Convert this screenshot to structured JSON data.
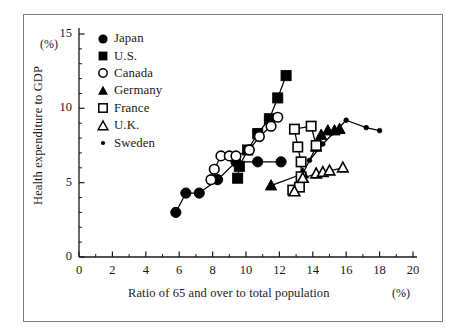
{
  "figure": {
    "frame": {
      "border_color": "#7d7d7d"
    }
  },
  "chart_data": {
    "type": "scatter",
    "title": "",
    "xlabel": "Ratio of 65 and over to total population",
    "ylabel": "Health expenditure to GDP",
    "x_unit": "(%)",
    "y_unit": "(%)",
    "xlim": [
      0,
      20
    ],
    "ylim": [
      0,
      15
    ],
    "xticks": [
      0,
      2,
      4,
      6,
      8,
      10,
      12,
      14,
      16,
      18,
      20
    ],
    "yticks": [
      0,
      5,
      10,
      15
    ],
    "xtick_labels": [
      "0",
      "2",
      "4",
      "6",
      "8",
      "10",
      "12",
      "14",
      "16",
      "18",
      "20"
    ],
    "ytick_labels": [
      "0",
      "5",
      "10",
      "15"
    ],
    "x_minor_step": 1,
    "y_minor_step": 1,
    "grid": false,
    "legend_position": "upper-left-inside",
    "connected": true,
    "series": [
      {
        "name": "Japan",
        "marker": "filled-circle",
        "color": "#000000",
        "points": [
          [
            5.8,
            3.0
          ],
          [
            6.4,
            4.3
          ],
          [
            7.2,
            4.3
          ],
          [
            8.3,
            5.2
          ],
          [
            9.4,
            6.4
          ],
          [
            10.7,
            6.4
          ],
          [
            12.1,
            6.4
          ]
        ]
      },
      {
        "name": "U.S.",
        "marker": "filled-square",
        "color": "#000000",
        "points": [
          [
            9.5,
            5.3
          ],
          [
            9.6,
            6.1
          ],
          [
            10.1,
            7.2
          ],
          [
            10.7,
            8.3
          ],
          [
            11.4,
            9.3
          ],
          [
            11.9,
            10.7
          ],
          [
            12.4,
            12.2
          ]
        ]
      },
      {
        "name": "Canada",
        "marker": "open-circle",
        "color": "#000000",
        "points": [
          [
            7.9,
            5.2
          ],
          [
            8.1,
            5.9
          ],
          [
            8.5,
            6.8
          ],
          [
            9.0,
            6.8
          ],
          [
            9.4,
            6.8
          ],
          [
            10.2,
            7.2
          ],
          [
            10.8,
            8.1
          ],
          [
            11.5,
            8.8
          ],
          [
            11.9,
            9.4
          ]
        ]
      },
      {
        "name": "Germany",
        "marker": "filled-triangle",
        "color": "#000000",
        "points": [
          [
            11.5,
            4.8
          ],
          [
            13.4,
            5.6
          ],
          [
            14.2,
            7.4
          ],
          [
            14.5,
            8.2
          ],
          [
            14.9,
            8.5
          ],
          [
            15.3,
            8.5
          ],
          [
            15.6,
            8.6
          ]
        ]
      },
      {
        "name": "France",
        "marker": "open-square",
        "color": "#000000",
        "points": [
          [
            12.8,
            4.5
          ],
          [
            13.2,
            4.7
          ],
          [
            13.3,
            5.4
          ],
          [
            13.3,
            6.4
          ],
          [
            13.1,
            7.4
          ],
          [
            12.9,
            8.6
          ],
          [
            13.9,
            8.8
          ],
          [
            14.2,
            7.5
          ]
        ]
      },
      {
        "name": "U.K.",
        "marker": "open-triangle",
        "color": "#000000",
        "points": [
          [
            12.9,
            4.4
          ],
          [
            13.4,
            5.3
          ],
          [
            14.2,
            5.6
          ],
          [
            14.6,
            5.7
          ],
          [
            15.0,
            5.8
          ],
          [
            15.8,
            6.0
          ]
        ]
      },
      {
        "name": "Sweden",
        "marker": "small-dot",
        "color": "#000000",
        "points": [
          [
            13.8,
            6.5
          ],
          [
            14.6,
            7.6
          ],
          [
            16.0,
            9.2
          ],
          [
            17.2,
            8.7
          ],
          [
            18.0,
            8.5
          ]
        ]
      }
    ]
  },
  "legend": {
    "items": [
      {
        "label": "Japan",
        "marker": "filled-circle"
      },
      {
        "label": "U.S.",
        "marker": "filled-square"
      },
      {
        "label": "Canada",
        "marker": "open-circle"
      },
      {
        "label": "Germany",
        "marker": "filled-triangle"
      },
      {
        "label": "France",
        "marker": "open-square"
      },
      {
        "label": "U.K.",
        "marker": "open-triangle"
      },
      {
        "label": "Sweden",
        "marker": "small-dot"
      }
    ]
  }
}
